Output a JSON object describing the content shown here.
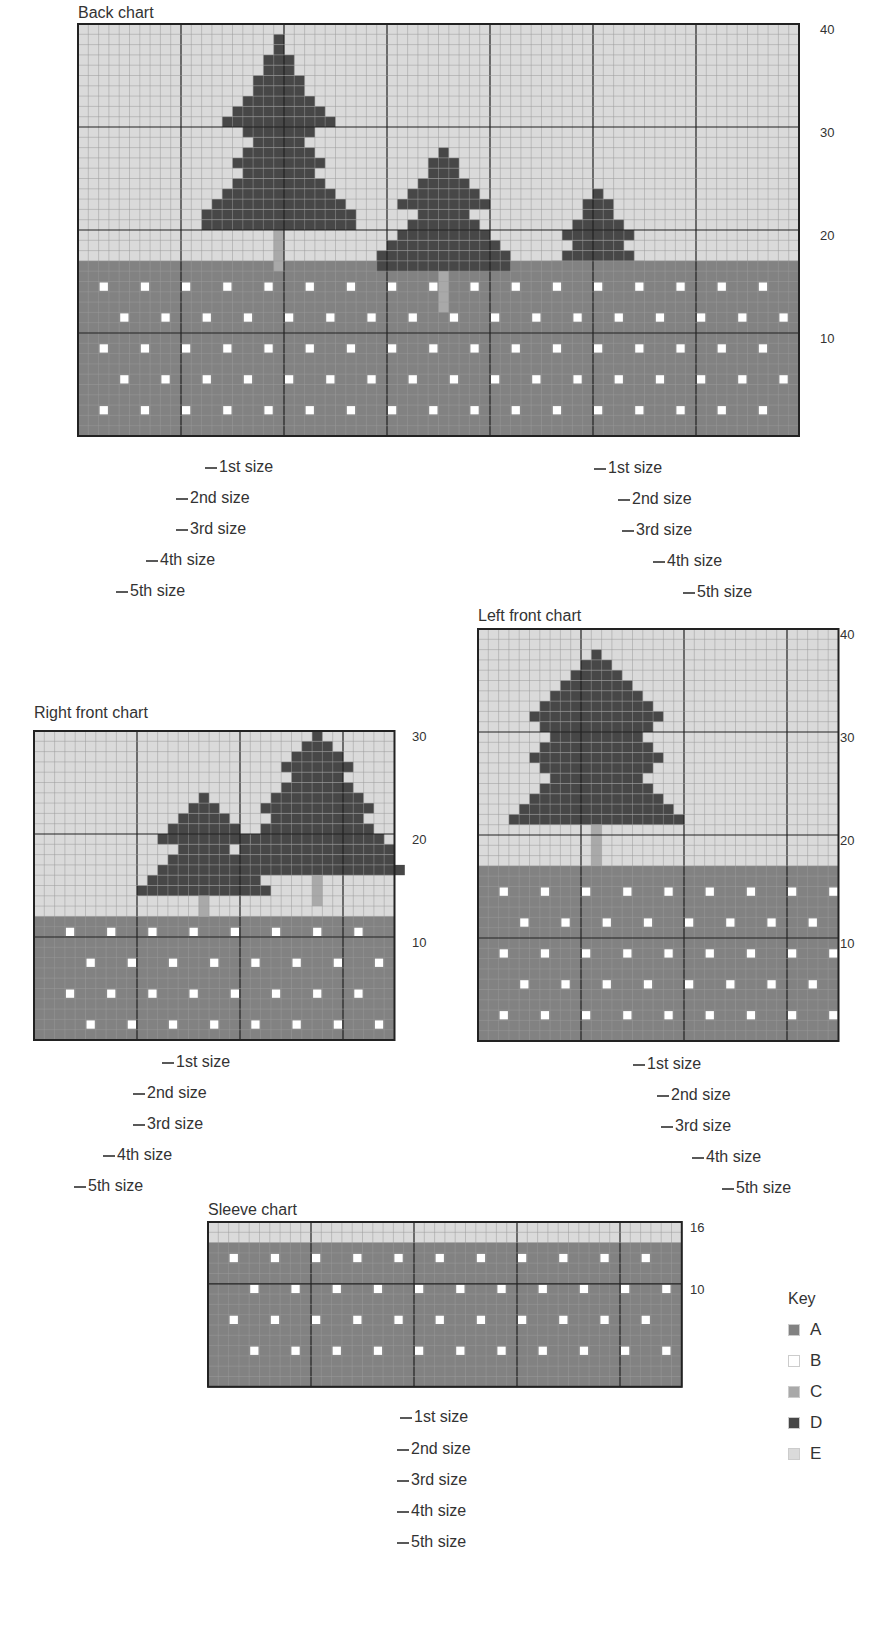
{
  "colors": {
    "A": "#828282",
    "B": "#ffffff",
    "C": "#a9a9a9",
    "D": "#474747",
    "E": "#dadada",
    "grid": "#9a9a9a",
    "major": "#222222"
  },
  "charts": [
    {
      "id": "back",
      "title": "Back chart",
      "title_pos": [
        78,
        6
      ],
      "x0": 78,
      "y0": 24,
      "cell": 10.3,
      "cols": 70,
      "rows": 40,
      "row_labels": [
        {
          "text": "40",
          "row": 40
        },
        {
          "text": "30",
          "row": 30
        },
        {
          "text": "20",
          "row": 20
        },
        {
          "text": "10",
          "row": 10
        }
      ],
      "label_x": 820,
      "size_labels": [
        {
          "text": "1st size",
          "x": 219,
          "y": 468
        },
        {
          "text": "2nd size",
          "x": 190,
          "y": 499
        },
        {
          "text": "3rd size",
          "x": 190,
          "y": 530
        },
        {
          "text": "4th size",
          "x": 160,
          "y": 561
        },
        {
          "text": "5th size",
          "x": 130,
          "y": 592
        },
        {
          "text": "1st size",
          "x": 608,
          "y": 469
        },
        {
          "text": "2nd size",
          "x": 632,
          "y": 500
        },
        {
          "text": "3rd size",
          "x": 636,
          "y": 531
        },
        {
          "text": "4th size",
          "x": 667,
          "y": 562
        },
        {
          "text": "5th size",
          "x": 697,
          "y": 593
        }
      ]
    },
    {
      "id": "right-front",
      "title": "Right front chart",
      "title_pos": [
        34,
        706
      ],
      "x0": 34,
      "y0": 731,
      "cell": 10.3,
      "cols": 35,
      "rows": 30,
      "row_labels": [
        {
          "text": "30",
          "row": 30
        },
        {
          "text": "20",
          "row": 20
        },
        {
          "text": "10",
          "row": 10
        }
      ],
      "label_x": 412,
      "size_labels": [
        {
          "text": "1st size",
          "x": 176,
          "y": 1063
        },
        {
          "text": "2nd size",
          "x": 147,
          "y": 1094
        },
        {
          "text": "3rd size",
          "x": 147,
          "y": 1125
        },
        {
          "text": "4th size",
          "x": 117,
          "y": 1156
        },
        {
          "text": "5th size",
          "x": 88,
          "y": 1187
        }
      ]
    },
    {
      "id": "left-front",
      "title": "Left front chart",
      "title_pos": [
        478,
        609
      ],
      "x0": 478,
      "y0": 629,
      "cell": 10.3,
      "cols": 35,
      "rows": 40,
      "row_labels": [
        {
          "text": "40",
          "row": 40
        },
        {
          "text": "30",
          "row": 30
        },
        {
          "text": "20",
          "row": 20
        },
        {
          "text": "10",
          "row": 10
        }
      ],
      "label_x": 840,
      "size_labels": [
        {
          "text": "1st size",
          "x": 647,
          "y": 1065
        },
        {
          "text": "2nd size",
          "x": 671,
          "y": 1096
        },
        {
          "text": "3rd size",
          "x": 675,
          "y": 1127
        },
        {
          "text": "4th size",
          "x": 706,
          "y": 1158
        },
        {
          "text": "5th size",
          "x": 736,
          "y": 1189
        }
      ]
    },
    {
      "id": "sleeve",
      "title": "Sleeve chart",
      "title_pos": [
        208,
        1203
      ],
      "x0": 208,
      "y0": 1222,
      "cell": 10.3,
      "cols": 46,
      "rows": 16,
      "row_labels": [
        {
          "text": "16",
          "row": 16
        },
        {
          "text": "10",
          "row": 10
        }
      ],
      "label_x": 690,
      "size_labels": [
        {
          "text": "1st size",
          "x": 414,
          "y": 1418
        },
        {
          "text": "2nd size",
          "x": 411,
          "y": 1450
        },
        {
          "text": "3rd size",
          "x": 411,
          "y": 1481
        },
        {
          "text": "4th size",
          "x": 411,
          "y": 1512
        },
        {
          "text": "5th size",
          "x": 411,
          "y": 1543
        }
      ]
    }
  ],
  "key": {
    "title": "Key",
    "items": [
      {
        "label": "A",
        "color": "#828282"
      },
      {
        "label": "B",
        "color": "#ffffff"
      },
      {
        "label": "C",
        "color": "#a9a9a9"
      },
      {
        "label": "D",
        "color": "#474747"
      },
      {
        "label": "E",
        "color": "#dadada"
      }
    ]
  }
}
